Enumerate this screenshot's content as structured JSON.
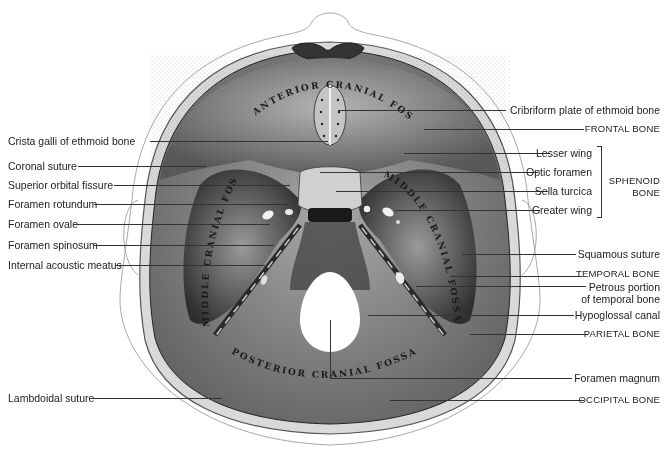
{
  "figure": {
    "fossa_labels": {
      "anterior": "ANTERIOR CRANIAL FOSSA",
      "middle_left": "MIDDLE CRANIAL FOSSA",
      "middle_right": "MIDDLE CRANIAL FOSSA",
      "posterior": "POSTERIOR CRANIAL FOSSA"
    }
  },
  "labels_left": [
    {
      "text": "Crista galli of ethmoid bone",
      "y": 141
    },
    {
      "text": "Coronal suture",
      "y": 166
    },
    {
      "text": "Superior orbital fissure",
      "y": 185
    },
    {
      "text": "Foramen rotundum",
      "y": 204
    },
    {
      "text": "Foramen ovale",
      "y": 224
    },
    {
      "text": "Foramen spinosum",
      "y": 245
    },
    {
      "text": "Internal acoustic meatus",
      "y": 265
    },
    {
      "text": "Lambdoidal suture",
      "y": 398
    }
  ],
  "labels_right": [
    {
      "text": "Cribriform plate of ethmoid bone",
      "y": 110
    },
    {
      "text": "FRONTAL BONE",
      "y": 129,
      "caps": true
    },
    {
      "text": "Lesser wing",
      "y": 153
    },
    {
      "text": "Optic foramen",
      "y": 172
    },
    {
      "text": "Sella turcica",
      "y": 191
    },
    {
      "text": "Greater wing",
      "y": 210
    },
    {
      "text": "Squamous suture",
      "y": 254
    },
    {
      "text": "TEMPORAL BONE",
      "y": 274,
      "caps": true
    },
    {
      "text": "Petrous portion",
      "y": 286
    },
    {
      "text": "of temporal bone",
      "y": 298
    },
    {
      "text": "Hypoglossal canal",
      "y": 315
    },
    {
      "text": "PARIETAL BONE",
      "y": 334,
      "caps": true
    },
    {
      "text": "Foramen magnum",
      "y": 378
    },
    {
      "text": "OCCIPITAL BONE",
      "y": 400,
      "caps": true
    }
  ],
  "group_label": {
    "line1": "SPHENOID",
    "line2": "BONE"
  },
  "colors": {
    "bone_dark": "#3a3a3a",
    "bone_mid": "#8a8a8a",
    "bone_light": "#c8c8c8",
    "outline": "#9a9a9a",
    "leader": "#333333"
  }
}
